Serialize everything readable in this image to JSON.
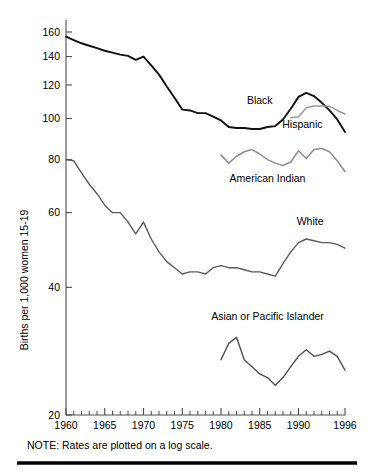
{
  "chart_data": {
    "type": "line",
    "title": "",
    "xlabel": "",
    "ylabel": "Births per 1,000 women 15-19",
    "note": "NOTE: Rates are plotted on a log scale.",
    "yscale": "log",
    "ylim": [
      20,
      168
    ],
    "xlim": [
      1960,
      1996
    ],
    "grid": false,
    "legend_position": "inline-labels",
    "ytick_labels": [
      "160",
      "140",
      "120",
      "100",
      "80",
      "60",
      "40",
      "20"
    ],
    "ytick_values": [
      160,
      140,
      120,
      100,
      80,
      60,
      40,
      20
    ],
    "xtick_labels": [
      "1960",
      "1965",
      "1970",
      "1975",
      "1980",
      "1985",
      "1990",
      "1996"
    ],
    "xtick_values": [
      1960,
      1965,
      1970,
      1975,
      1980,
      1985,
      1990,
      1996
    ],
    "xtick_minor_values": [
      1961,
      1962,
      1963,
      1964,
      1966,
      1967,
      1968,
      1969,
      1971,
      1972,
      1973,
      1974,
      1976,
      1977,
      1978,
      1979,
      1981,
      1982,
      1983,
      1984,
      1986,
      1987,
      1988,
      1989,
      1991,
      1992,
      1993,
      1994,
      1995
    ],
    "series": [
      {
        "name": "Black",
        "color": "#111111",
        "width": 1.9,
        "label_x": 1985.0,
        "label_y": 108.5,
        "label_anchor": "middle",
        "x": [
          1960,
          1961,
          1962,
          1963,
          1964,
          1965,
          1966,
          1967,
          1968,
          1969,
          1970,
          1971,
          1972,
          1973,
          1974,
          1975,
          1976,
          1977,
          1978,
          1979,
          1980,
          1981,
          1982,
          1983,
          1984,
          1985,
          1986,
          1987,
          1988,
          1989,
          1990,
          1991,
          1992,
          1993,
          1994,
          1995,
          1996
        ],
        "values": [
          156.0,
          153.0,
          150.5,
          148.5,
          146.5,
          144.5,
          143.0,
          141.5,
          140.5,
          137.5,
          140.0,
          133.5,
          127.0,
          119.0,
          112.0,
          105.0,
          104.5,
          103.0,
          103.0,
          101.0,
          99.0,
          95.5,
          95.0,
          95.0,
          94.5,
          94.5,
          95.5,
          96.0,
          99.5,
          105.5,
          112.5,
          115.0,
          113.0,
          109.0,
          104.5,
          99.5,
          93.0
        ]
      },
      {
        "name": "Hispanic",
        "color": "#9a9a9a",
        "width": 1.5,
        "label_x": 1990.5,
        "label_y": 95.0,
        "label_anchor": "middle",
        "x": [
          1989,
          1990,
          1991,
          1992,
          1993,
          1994,
          1995,
          1996
        ],
        "values": [
          100.5,
          101.0,
          106.0,
          107.0,
          107.0,
          107.0,
          104.5,
          102.5
        ]
      },
      {
        "name": "American Indian",
        "color": "#8e8e8e",
        "width": 1.5,
        "label_x": 1986.0,
        "label_y": 71.0,
        "label_anchor": "middle",
        "x": [
          1980,
          1981,
          1982,
          1983,
          1984,
          1985,
          1986,
          1987,
          1988,
          1989,
          1990,
          1991,
          1992,
          1993,
          1994,
          1995,
          1996
        ],
        "values": [
          82.0,
          78.5,
          81.5,
          83.5,
          84.5,
          82.5,
          80.0,
          78.5,
          77.5,
          79.0,
          84.0,
          80.5,
          84.5,
          85.0,
          83.5,
          79.5,
          75.0
        ]
      },
      {
        "name": "White",
        "color": "#5a5a5a",
        "width": 1.4,
        "label_x": 1991.5,
        "label_y": 56.0,
        "label_anchor": "middle",
        "x": [
          1960,
          1961,
          1962,
          1963,
          1964,
          1965,
          1966,
          1967,
          1968,
          1969,
          1970,
          1971,
          1972,
          1973,
          1974,
          1975,
          1976,
          1977,
          1978,
          1979,
          1980,
          1981,
          1982,
          1983,
          1984,
          1985,
          1986,
          1987,
          1988,
          1989,
          1990,
          1991,
          1992,
          1993,
          1994,
          1995,
          1996
        ],
        "values": [
          80.0,
          79.5,
          74.5,
          70.0,
          66.5,
          62.5,
          60.0,
          60.0,
          57.0,
          53.5,
          57.0,
          52.0,
          48.5,
          46.0,
          44.5,
          43.0,
          43.5,
          43.5,
          43.0,
          44.5,
          45.0,
          44.5,
          44.5,
          44.0,
          43.5,
          43.5,
          43.0,
          42.5,
          45.5,
          48.5,
          51.0,
          52.0,
          51.5,
          51.0,
          51.0,
          50.5,
          49.5
        ]
      },
      {
        "name": "Asian or Pacific Islander",
        "color": "#4f4f4f",
        "width": 1.4,
        "label_x": 1986.0,
        "label_y": 33.5,
        "label_anchor": "middle",
        "x": [
          1980,
          1981,
          1982,
          1983,
          1984,
          1985,
          1986,
          1987,
          1988,
          1989,
          1990,
          1991,
          1992,
          1993,
          1994,
          1995,
          1996
        ],
        "values": [
          27.0,
          29.5,
          30.5,
          27.0,
          26.0,
          25.0,
          24.5,
          23.5,
          24.5,
          26.0,
          27.5,
          28.5,
          27.5,
          27.8,
          28.3,
          27.5,
          25.5
        ]
      }
    ]
  },
  "plot_geometry": {
    "left": 66,
    "right": 345,
    "top": 23,
    "bottom": 415,
    "note_x": 27,
    "note_y": 449,
    "ytitle_x": 28,
    "ytitle_y": 280,
    "rule_x1": 17,
    "rule_x2": 357,
    "rule_y": 463
  }
}
